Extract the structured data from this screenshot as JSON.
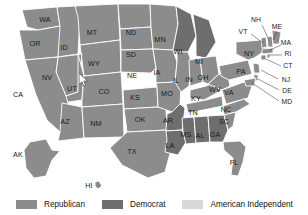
{
  "map": {
    "title": "United States election results by state",
    "projection": "albers-usa",
    "cursor": {
      "name": "mouse-pointer",
      "x": 79,
      "y": 73
    },
    "palette": {
      "republican": "#8c8c8c",
      "democrat": "#6e6e6e",
      "american_independent": "#d8d8d8",
      "border": "#ffffff",
      "background": "#ffffff",
      "label": "#1a1a1a"
    },
    "states": [
      {
        "code": "WA",
        "party": "republican",
        "lx": 45,
        "ly": 20
      },
      {
        "code": "OR",
        "party": "republican",
        "lx": 35,
        "ly": 44
      },
      {
        "code": "ID",
        "party": "republican",
        "lx": 64,
        "ly": 48
      },
      {
        "code": "MT",
        "party": "republican",
        "lx": 92,
        "ly": 33
      },
      {
        "code": "WY",
        "party": "republican",
        "lx": 94,
        "ly": 64
      },
      {
        "code": "ND",
        "party": "republican",
        "lx": 131,
        "ly": 33
      },
      {
        "code": "SD",
        "party": "republican",
        "lx": 131,
        "ly": 55
      },
      {
        "code": "NE",
        "party": "republican",
        "lx": 132,
        "ly": 76
      },
      {
        "code": "MN",
        "party": "republican",
        "lx": 160,
        "ly": 40
      },
      {
        "code": "IA",
        "party": "republican",
        "lx": 157,
        "ly": 73
      },
      {
        "code": "WI",
        "party": "democrat",
        "lx": 178,
        "ly": 52
      },
      {
        "code": "MI",
        "party": "democrat",
        "lx": 199,
        "ly": 62
      },
      {
        "code": "NV",
        "party": "republican",
        "lx": 47,
        "ly": 78
      },
      {
        "code": "UT",
        "party": "republican",
        "lx": 72,
        "ly": 89
      },
      {
        "code": "CO",
        "party": "republican",
        "lx": 104,
        "ly": 92
      },
      {
        "code": "CA",
        "party": "republican",
        "lx": 18,
        "ly": 95
      },
      {
        "code": "AZ",
        "party": "republican",
        "lx": 65,
        "ly": 122
      },
      {
        "code": "NM",
        "party": "republican",
        "lx": 96,
        "ly": 124
      },
      {
        "code": "KS",
        "party": "republican",
        "lx": 135,
        "ly": 98
      },
      {
        "code": "OK",
        "party": "republican",
        "lx": 140,
        "ly": 120
      },
      {
        "code": "TX",
        "party": "republican",
        "lx": 132,
        "ly": 152
      },
      {
        "code": "MO",
        "party": "republican",
        "lx": 167,
        "ly": 94
      },
      {
        "code": "AR",
        "party": "democrat",
        "lx": 168,
        "ly": 121
      },
      {
        "code": "LA",
        "party": "democrat",
        "lx": 170,
        "ly": 146
      },
      {
        "code": "MS",
        "party": "democrat",
        "lx": 186,
        "ly": 135
      },
      {
        "code": "AL",
        "party": "democrat",
        "lx": 200,
        "ly": 136
      },
      {
        "code": "GA",
        "party": "democrat",
        "lx": 215,
        "ly": 135
      },
      {
        "code": "IL",
        "party": "republican",
        "lx": 176,
        "ly": 81
      },
      {
        "code": "IN",
        "party": "republican",
        "lx": 189,
        "ly": 80
      },
      {
        "code": "OH",
        "party": "republican",
        "lx": 203,
        "ly": 78
      },
      {
        "code": "KY",
        "party": "republican",
        "lx": 196,
        "ly": 99
      },
      {
        "code": "TN",
        "party": "republican",
        "lx": 193,
        "ly": 113
      },
      {
        "code": "WV",
        "party": "republican",
        "lx": 215,
        "ly": 90
      },
      {
        "code": "VA",
        "party": "republican",
        "lx": 229,
        "ly": 93
      },
      {
        "code": "NC",
        "party": "republican",
        "lx": 226,
        "ly": 110
      },
      {
        "code": "SC",
        "party": "republican",
        "lx": 224,
        "ly": 122
      },
      {
        "code": "FL",
        "party": "republican",
        "lx": 234,
        "ly": 163
      },
      {
        "code": "PA",
        "party": "republican",
        "lx": 241,
        "ly": 72
      },
      {
        "code": "NY",
        "party": "republican",
        "lx": 249,
        "ly": 54
      },
      {
        "code": "AK",
        "party": "republican",
        "lx": 18,
        "ly": 155
      },
      {
        "code": "HI",
        "party": "republican",
        "lx": 89,
        "ly": 186
      }
    ],
    "callouts": [
      {
        "code": "NH",
        "party": "republican",
        "lx": 256,
        "ly": 20,
        "x1": 262,
        "y1": 25,
        "x2": 268,
        "y2": 38
      },
      {
        "code": "VT",
        "party": "republican",
        "lx": 243,
        "ly": 32,
        "x1": 251,
        "y1": 34,
        "x2": 263,
        "y2": 43
      },
      {
        "code": "ME",
        "party": "republican",
        "lx": 277,
        "ly": 27,
        "x1": 277,
        "y1": 32,
        "x2": 273,
        "y2": 40
      },
      {
        "code": "MA",
        "party": "republican",
        "lx": 286,
        "ly": 43,
        "x1": 281,
        "y1": 45,
        "x2": 270,
        "y2": 50
      },
      {
        "code": "RI",
        "party": "republican",
        "lx": 288,
        "ly": 54,
        "x1": 282,
        "y1": 55,
        "x2": 269,
        "y2": 55
      },
      {
        "code": "CT",
        "party": "republican",
        "lx": 288,
        "ly": 66,
        "x1": 281,
        "y1": 66,
        "x2": 266,
        "y2": 59
      },
      {
        "code": "NJ",
        "party": "republican",
        "lx": 286,
        "ly": 80,
        "x1": 278,
        "y1": 79,
        "x2": 261,
        "y2": 70
      },
      {
        "code": "DE",
        "party": "republican",
        "lx": 287,
        "ly": 91,
        "x1": 279,
        "y1": 90,
        "x2": 258,
        "y2": 79
      },
      {
        "code": "MD",
        "party": "republican",
        "lx": 287,
        "ly": 102,
        "x1": 279,
        "y1": 101,
        "x2": 252,
        "y2": 83
      }
    ]
  },
  "legend": {
    "name": "party-legend",
    "items": [
      {
        "label": "Republican",
        "color": "#8c8c8c"
      },
      {
        "label": "Democrat",
        "color": "#6e6e6e"
      },
      {
        "label": "American Independent",
        "color": "#d8d8d8"
      }
    ]
  }
}
